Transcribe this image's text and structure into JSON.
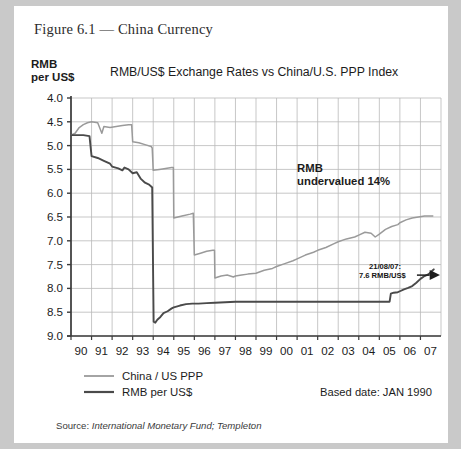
{
  "figure": {
    "caption": "Figure 6.1 — China Currency"
  },
  "chart_data": {
    "type": "line",
    "title": "RMB/US$ Exchange Rates vs China/U.S. PPP Index",
    "ylabel_line1": "RMB",
    "ylabel_line2": "per US$",
    "xlabel": "",
    "y_inverted": true,
    "ylim": [
      4.0,
      9.0
    ],
    "yticks": [
      "4.0",
      "4.5",
      "5.0",
      "5.5",
      "6.0",
      "6.5",
      "7.0",
      "7.5",
      "8.0",
      "8.5",
      "9.0"
    ],
    "ytick_values": [
      4.0,
      4.5,
      5.0,
      5.5,
      6.0,
      6.5,
      7.0,
      7.5,
      8.0,
      8.5,
      9.0
    ],
    "xticks": [
      "90",
      "91",
      "92",
      "93",
      "94",
      "95",
      "96",
      "97",
      "98",
      "99",
      "00",
      "01",
      "02",
      "03",
      "04",
      "05",
      "06",
      "07"
    ],
    "xtick_values": [
      1990,
      1991,
      1992,
      1993,
      1994,
      1995,
      1996,
      1997,
      1998,
      1999,
      2000,
      2001,
      2002,
      2003,
      2004,
      2005,
      2006,
      2007
    ],
    "xlim": [
      1990,
      2008
    ],
    "grid": true,
    "legend_position": "below-left",
    "series": [
      {
        "name": "China / US PPP",
        "color": "#9a9a9a",
        "points": [
          [
            1990.0,
            4.78
          ],
          [
            1990.2,
            4.74
          ],
          [
            1990.4,
            4.62
          ],
          [
            1990.6,
            4.56
          ],
          [
            1990.8,
            4.52
          ],
          [
            1991.0,
            4.5
          ],
          [
            1991.3,
            4.52
          ],
          [
            1991.5,
            4.74
          ],
          [
            1991.6,
            4.6
          ],
          [
            1991.9,
            4.62
          ],
          [
            1992.2,
            4.6
          ],
          [
            1992.5,
            4.58
          ],
          [
            1992.8,
            4.56
          ],
          [
            1992.95,
            4.56
          ],
          [
            1993.0,
            4.92
          ],
          [
            1993.3,
            4.94
          ],
          [
            1993.6,
            4.98
          ],
          [
            1993.9,
            5.02
          ],
          [
            1993.95,
            5.05
          ],
          [
            1994.0,
            5.52
          ],
          [
            1994.3,
            5.5
          ],
          [
            1994.6,
            5.48
          ],
          [
            1994.9,
            5.46
          ],
          [
            1994.98,
            5.46
          ],
          [
            1995.0,
            6.52
          ],
          [
            1995.4,
            6.48
          ],
          [
            1995.8,
            6.44
          ],
          [
            1995.95,
            6.42
          ],
          [
            1996.0,
            7.3
          ],
          [
            1996.3,
            7.26
          ],
          [
            1996.6,
            7.22
          ],
          [
            1996.9,
            7.2
          ],
          [
            1996.98,
            7.2
          ],
          [
            1997.0,
            7.78
          ],
          [
            1997.3,
            7.74
          ],
          [
            1997.6,
            7.72
          ],
          [
            1997.9,
            7.76
          ],
          [
            1998.0,
            7.74
          ],
          [
            1998.3,
            7.72
          ],
          [
            1998.6,
            7.7
          ],
          [
            1999.0,
            7.68
          ],
          [
            1999.4,
            7.62
          ],
          [
            1999.8,
            7.58
          ],
          [
            2000.0,
            7.54
          ],
          [
            2000.4,
            7.48
          ],
          [
            2000.8,
            7.42
          ],
          [
            2001.0,
            7.38
          ],
          [
            2001.4,
            7.3
          ],
          [
            2001.8,
            7.24
          ],
          [
            2002.0,
            7.2
          ],
          [
            2002.4,
            7.14
          ],
          [
            2002.8,
            7.06
          ],
          [
            2003.0,
            7.02
          ],
          [
            2003.4,
            6.96
          ],
          [
            2003.8,
            6.92
          ],
          [
            2004.0,
            6.88
          ],
          [
            2004.3,
            6.82
          ],
          [
            2004.6,
            6.84
          ],
          [
            2004.8,
            6.92
          ],
          [
            2005.0,
            6.86
          ],
          [
            2005.3,
            6.76
          ],
          [
            2005.6,
            6.7
          ],
          [
            2005.9,
            6.66
          ],
          [
            2006.0,
            6.62
          ],
          [
            2006.3,
            6.56
          ],
          [
            2006.6,
            6.52
          ],
          [
            2006.9,
            6.5
          ],
          [
            2007.2,
            6.48
          ],
          [
            2007.6,
            6.48
          ]
        ]
      },
      {
        "name": "RMB per US$",
        "color": "#4a4a4a",
        "points": [
          [
            1990.0,
            4.78
          ],
          [
            1990.3,
            4.78
          ],
          [
            1990.6,
            4.78
          ],
          [
            1990.9,
            4.8
          ],
          [
            1991.0,
            5.22
          ],
          [
            1991.3,
            5.26
          ],
          [
            1991.6,
            5.32
          ],
          [
            1991.9,
            5.38
          ],
          [
            1992.0,
            5.44
          ],
          [
            1992.3,
            5.48
          ],
          [
            1992.5,
            5.52
          ],
          [
            1992.6,
            5.46
          ],
          [
            1992.8,
            5.5
          ],
          [
            1993.0,
            5.58
          ],
          [
            1993.2,
            5.56
          ],
          [
            1993.4,
            5.7
          ],
          [
            1993.6,
            5.78
          ],
          [
            1993.8,
            5.82
          ],
          [
            1993.9,
            5.86
          ],
          [
            1993.95,
            5.88
          ],
          [
            1994.02,
            8.7
          ],
          [
            1994.1,
            8.72
          ],
          [
            1994.2,
            8.66
          ],
          [
            1994.35,
            8.6
          ],
          [
            1994.5,
            8.52
          ],
          [
            1994.7,
            8.48
          ],
          [
            1994.9,
            8.42
          ],
          [
            1995.0,
            8.4
          ],
          [
            1995.3,
            8.36
          ],
          [
            1995.6,
            8.33
          ],
          [
            1995.9,
            8.32
          ],
          [
            1996.2,
            8.32
          ],
          [
            1996.6,
            8.31
          ],
          [
            1997.0,
            8.3
          ],
          [
            1997.5,
            8.29
          ],
          [
            1998.0,
            8.28
          ],
          [
            1999.0,
            8.28
          ],
          [
            2000.0,
            8.28
          ],
          [
            2001.0,
            8.28
          ],
          [
            2002.0,
            8.28
          ],
          [
            2003.0,
            8.28
          ],
          [
            2004.0,
            8.28
          ],
          [
            2005.0,
            8.28
          ],
          [
            2005.5,
            8.28
          ],
          [
            2005.56,
            8.11
          ],
          [
            2005.7,
            8.09
          ],
          [
            2005.9,
            8.08
          ],
          [
            2006.0,
            8.06
          ],
          [
            2006.2,
            8.02
          ],
          [
            2006.4,
            7.99
          ],
          [
            2006.6,
            7.95
          ],
          [
            2006.8,
            7.88
          ],
          [
            2007.0,
            7.8
          ],
          [
            2007.2,
            7.74
          ],
          [
            2007.4,
            7.7
          ],
          [
            2007.6,
            7.62
          ],
          [
            2007.65,
            7.6
          ]
        ]
      }
    ],
    "annotations": [
      {
        "name": "rmb-undervalued",
        "line1": "RMB",
        "line2": "undervalued 14%",
        "x": 2001.0,
        "y": 5.55
      },
      {
        "name": "latest-rate-callout",
        "line1": "21/08/07:",
        "line2": "7.6 RMB/US$",
        "x": 2004.3,
        "y": 7.7
      }
    ],
    "based_date": "Based date: JAN 1990"
  },
  "source": {
    "prefix": "Source: ",
    "text": "International Monetary Fund; Templeton"
  }
}
